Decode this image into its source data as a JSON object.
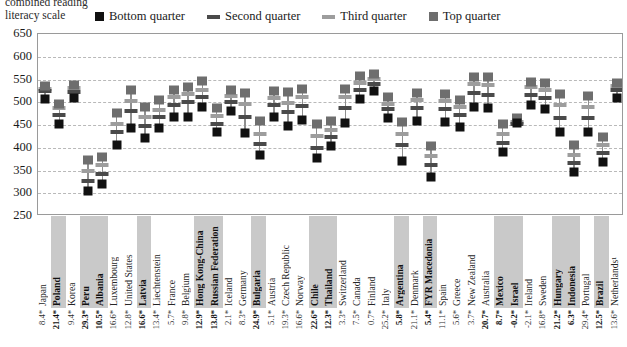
{
  "header": {
    "title_line1": "combined reading",
    "title_line2": "literacy scale"
  },
  "colors": {
    "bottom_quarter": "#111111",
    "second_quarter": "#4a4a4a",
    "third_quarter": "#9d9d9d",
    "top_quarter": "#6e6e6e",
    "stem": "#8f8f8f",
    "gridline": "#b9b9b9",
    "highlight_band": "#c9c9c9"
  },
  "chart_data": {
    "type": "scatter",
    "title": "combined reading literacy scale",
    "xlabel": "",
    "ylabel": "",
    "ylim": [
      250,
      650
    ],
    "yticks": [
      650,
      600,
      550,
      500,
      450,
      400,
      350,
      300,
      250
    ],
    "grid": true,
    "legend_position": "top",
    "legend": [
      "Bottom quarter",
      "Second quarter",
      "Third quarter",
      "Top quarter"
    ],
    "series": [
      {
        "name": "Bottom quarter",
        "marker": "square",
        "color": "#111111"
      },
      {
        "name": "Second quarter",
        "marker": "dash",
        "color": "#4a4a4a"
      },
      {
        "name": "Third quarter",
        "marker": "dash",
        "color": "#9d9d9d"
      },
      {
        "name": "Top quarter",
        "marker": "square",
        "color": "#6e6e6e"
      }
    ],
    "categories": [
      "Japan",
      "Poland",
      "Korea",
      "Peru",
      "Albania",
      "Luxembourg",
      "United States",
      "Latvia",
      "Liechtenstein",
      "France",
      "Belgium",
      "Hong Kong-China",
      "Russian Federation",
      "Iceland",
      "Germany",
      "Bulgaria",
      "Austria",
      "Czech Republic",
      "Norway",
      "Chile",
      "Thailand",
      "Switzerland",
      "Canada",
      "Finland",
      "Italy",
      "Argentina",
      "Denmark",
      "FYR Macedonia",
      "Spain",
      "Greece",
      "New Zealand",
      "Australia",
      "Mexico",
      "Israel",
      "Ireland",
      "Sweden",
      "Hungary",
      "Indonesia",
      "Portugal",
      "Brazil",
      "Netherlands¹"
    ],
    "highlighted_categories": [
      "Poland",
      "Peru",
      "Albania",
      "Latvia",
      "Hong Kong-China",
      "Russian Federation",
      "Bulgaria",
      "Chile",
      "Thailand",
      "Argentina",
      "FYR Macedonia",
      "Mexico",
      "Israel",
      "Hungary",
      "Indonesia",
      "Brazil"
    ],
    "bottom_row_label": "percentage of variance explained",
    "bottom_row_values": [
      "8.4*",
      "21.4*",
      "9.4*",
      "29.3*",
      "10.5*",
      "16.6*",
      "12.8*",
      "16.6*",
      "13.4*",
      "5.7*",
      "9.8*",
      "12.9*",
      "13.8*",
      "2.1*",
      "8.3*",
      "24.9*",
      "5.1*",
      "19.3*",
      "16.6*",
      "22.6*",
      "12.3*",
      "3.3*",
      "7.5*",
      "0.7*",
      "25.2*",
      "5.8*",
      "21.1*",
      "5.4*",
      "11.1*",
      "5.6*",
      "3.7*",
      "20.7*",
      "8.7*",
      "-0.2*",
      "-2.1*",
      "16.8*",
      "21.2*",
      "6.3*",
      "29.4*",
      "12.5*",
      "13.6*"
    ],
    "bottom_row_bold": [
      false,
      true,
      false,
      true,
      true,
      false,
      false,
      true,
      false,
      false,
      false,
      true,
      true,
      false,
      false,
      true,
      false,
      false,
      false,
      true,
      true,
      false,
      false,
      false,
      false,
      true,
      false,
      true,
      false,
      false,
      false,
      true,
      true,
      true,
      false,
      false,
      true,
      true,
      false,
      true,
      false
    ],
    "data": [
      {
        "category": "Japan",
        "bottom": 507,
        "second": 524,
        "third": 530,
        "top": 535
      },
      {
        "category": "Poland",
        "bottom": 452,
        "second": 472,
        "third": 488,
        "top": 497
      },
      {
        "category": "Korea",
        "bottom": 509,
        "second": 522,
        "third": 531,
        "top": 537
      },
      {
        "category": "Peru",
        "bottom": 305,
        "second": 327,
        "third": 348,
        "top": 372
      },
      {
        "category": "Albania",
        "bottom": 320,
        "second": 343,
        "third": 362,
        "top": 380
      },
      {
        "category": "Luxembourg",
        "bottom": 406,
        "second": 434,
        "third": 452,
        "top": 477
      },
      {
        "category": "United States",
        "bottom": 443,
        "second": 480,
        "third": 503,
        "top": 528
      },
      {
        "category": "Latvia",
        "bottom": 422,
        "second": 447,
        "third": 467,
        "top": 490
      },
      {
        "category": "Liechtenstein",
        "bottom": 443,
        "second": 468,
        "third": 483,
        "top": 504
      },
      {
        "category": "France",
        "bottom": 468,
        "second": 495,
        "third": 511,
        "top": 526
      },
      {
        "category": "Belgium",
        "bottom": 468,
        "second": 500,
        "third": 518,
        "top": 533
      },
      {
        "category": "Hong Kong-China",
        "bottom": 489,
        "second": 511,
        "third": 528,
        "top": 547
      },
      {
        "category": "Russian Federation",
        "bottom": 434,
        "second": 453,
        "third": 470,
        "top": 487
      },
      {
        "category": "Iceland",
        "bottom": 480,
        "second": 501,
        "third": 513,
        "top": 527
      },
      {
        "category": "Germany",
        "bottom": 432,
        "second": 467,
        "third": 497,
        "top": 520
      },
      {
        "category": "Bulgaria",
        "bottom": 385,
        "second": 409,
        "third": 431,
        "top": 458
      },
      {
        "category": "Austria",
        "bottom": 468,
        "second": 494,
        "third": 510,
        "top": 524
      },
      {
        "category": "Czech Republic",
        "bottom": 447,
        "second": 479,
        "third": 499,
        "top": 522
      },
      {
        "category": "Norway",
        "bottom": 462,
        "second": 491,
        "third": 512,
        "top": 529
      },
      {
        "category": "Chile",
        "bottom": 378,
        "second": 400,
        "third": 425,
        "top": 452
      },
      {
        "category": "Thailand",
        "bottom": 403,
        "second": 423,
        "third": 440,
        "top": 459
      },
      {
        "category": "Switzerland",
        "bottom": 454,
        "second": 487,
        "third": 511,
        "top": 530
      },
      {
        "category": "Canada",
        "bottom": 507,
        "second": 528,
        "third": 543,
        "top": 557
      },
      {
        "category": "Finland",
        "bottom": 524,
        "second": 540,
        "third": 551,
        "top": 561
      },
      {
        "category": "Italy",
        "bottom": 465,
        "second": 485,
        "third": 496,
        "top": 511
      },
      {
        "category": "Argentina",
        "bottom": 370,
        "second": 405,
        "third": 430,
        "top": 457
      },
      {
        "category": "Denmark",
        "bottom": 458,
        "second": 487,
        "third": 504,
        "top": 521
      },
      {
        "category": "FYR Macedonia",
        "bottom": 335,
        "second": 362,
        "third": 382,
        "top": 404
      },
      {
        "category": "Spain",
        "bottom": 456,
        "second": 485,
        "third": 502,
        "top": 518
      },
      {
        "category": "Greece",
        "bottom": 446,
        "second": 473,
        "third": 489,
        "top": 505
      },
      {
        "category": "New Zealand",
        "bottom": 489,
        "second": 521,
        "third": 540,
        "top": 556
      },
      {
        "category": "Australia",
        "bottom": 487,
        "second": 517,
        "third": 538,
        "top": 556
      },
      {
        "category": "Mexico",
        "bottom": 391,
        "second": 411,
        "third": 430,
        "top": 453
      },
      {
        "category": "Israel",
        "bottom": 454,
        "second": 452,
        "third": 457,
        "top": 466
      },
      {
        "category": "Ireland",
        "bottom": 495,
        "second": 515,
        "third": 533,
        "top": 545
      },
      {
        "category": "Sweden",
        "bottom": 486,
        "second": 510,
        "third": 528,
        "top": 542
      },
      {
        "category": "Hungary",
        "bottom": 434,
        "second": 466,
        "third": 493,
        "top": 518
      },
      {
        "category": "Indonesia",
        "bottom": 346,
        "second": 366,
        "third": 384,
        "top": 406
      },
      {
        "category": "Portugal",
        "bottom": 434,
        "second": 465,
        "third": 490,
        "top": 513
      },
      {
        "category": "Brazil",
        "bottom": 368,
        "second": 389,
        "third": 407,
        "top": 424
      },
      {
        "category": "Netherlands¹",
        "bottom": 509,
        "second": 527,
        "third": 536,
        "top": 542
      }
    ]
  }
}
